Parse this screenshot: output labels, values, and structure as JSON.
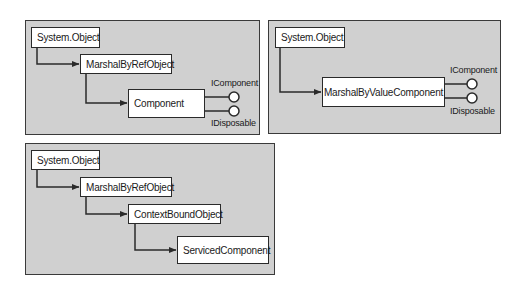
{
  "diagrams": [
    {
      "id": "component-hierarchy",
      "classes": [
        "System.Object",
        "MarshalByRefObject",
        "Component"
      ],
      "interfaces": [
        "IComponent",
        "IDisposable"
      ]
    },
    {
      "id": "marshal-by-value-hierarchy",
      "classes": [
        "System.Object",
        "MarshalByValueComponent"
      ],
      "interfaces": [
        "IComponent",
        "IDisposable"
      ]
    },
    {
      "id": "serviced-component-hierarchy",
      "classes": [
        "System.Object",
        "MarshalByRefObject",
        "ContextBoundObject",
        "ServicedComponent"
      ],
      "interfaces": []
    }
  ],
  "colors": {
    "panel_bg": "#d0d0d0",
    "box_bg": "#ffffff",
    "line": "#2a2a2a"
  }
}
